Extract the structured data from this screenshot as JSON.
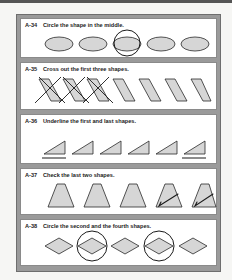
{
  "worksheet": {
    "sections": [
      {
        "id": "A-34",
        "instruction": "Circle the shape in the middle.",
        "shape": "ellipse",
        "count": 5,
        "marked": [
          3
        ],
        "mark": "circle"
      },
      {
        "id": "A-35",
        "instruction": "Cross out the first three shapes.",
        "shape": "parallelogram",
        "count": 7,
        "marked": [
          1,
          2,
          3
        ],
        "mark": "cross"
      },
      {
        "id": "A-36",
        "instruction": "Underline the first and last shapes.",
        "shape": "right-triangle",
        "count": 6,
        "marked": [
          1,
          6
        ],
        "mark": "underline"
      },
      {
        "id": "A-37",
        "instruction": "Check the last two shapes.",
        "shape": "trapezoid",
        "count": 5,
        "marked": [
          4,
          5
        ],
        "mark": "check"
      },
      {
        "id": "A-38",
        "instruction": "Circle the second and the fourth shapes.",
        "shape": "diamond",
        "count": 5,
        "marked": [
          2,
          4
        ],
        "mark": "circle"
      }
    ]
  },
  "colors": {
    "shape_fill": "#d6d6d6",
    "shape_stroke": "#2a2a2a",
    "mark_stroke": "#1a1a1a",
    "band": "#9a9a9a",
    "panel": "#ffffff"
  }
}
